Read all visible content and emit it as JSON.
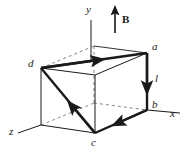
{
  "figure": {
    "background_color": "#ffffff",
    "line_color": "#1a1a1a",
    "labels": {
      "axis_y": "y",
      "axis_x": "x",
      "axis_z": "z",
      "field": "B",
      "vertex_a": "a",
      "vertex_b": "b",
      "vertex_c": "c",
      "vertex_d": "d",
      "segment_l": "l"
    },
    "geometry": {
      "vertex_a": {
        "x": 146,
        "y": 53
      },
      "vertex_b": {
        "x": 146,
        "y": 110
      },
      "vertex_c": {
        "x": 95,
        "y": 133
      },
      "vertex_d": {
        "x": 41,
        "y": 68
      },
      "front_bottom_left": {
        "x": 41,
        "y": 125
      },
      "back_top_left": {
        "x": 95,
        "y": 45
      },
      "back_bottom_center": {
        "x": 95,
        "y": 102
      },
      "origin": {
        "x": 41,
        "y": 125
      }
    },
    "axes": {
      "y_axis_top": {
        "x": 91,
        "y": 20
      },
      "x_axis_end": {
        "x": 180,
        "y": 113
      },
      "z_axis_end": {
        "x": 18,
        "y": 133
      }
    },
    "field_arrow": {
      "tail": {
        "x": 115,
        "y": 33
      },
      "head": {
        "x": 115,
        "y": 9
      },
      "direction": "up"
    },
    "current_path": [
      {
        "from": "d",
        "to": "a",
        "edge": "top-front"
      },
      {
        "from": "a",
        "to": "b",
        "edge": "right-vertical"
      },
      {
        "from": "b",
        "to": "c",
        "edge": "bottom-front"
      },
      {
        "from": "c",
        "to": "d",
        "edge": "face-diagonal"
      }
    ]
  }
}
